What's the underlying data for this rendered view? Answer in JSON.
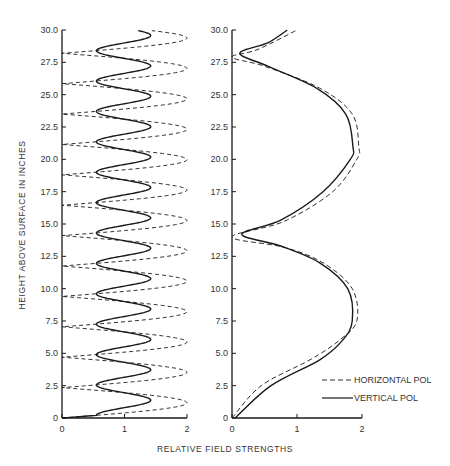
{
  "chart_data": [
    {
      "type": "line",
      "panel": "left",
      "title": "",
      "xlabel": "RELATIVE FIELD STRENGTHS",
      "ylabel": "HEIGHT ABOVE SURFACE IN INCHES",
      "xlim": [
        0,
        2
      ],
      "ylim": [
        0,
        30
      ],
      "x_ticks": [
        "0",
        "1",
        "2"
      ],
      "y_ticks": [
        "0",
        "2.5",
        "5.0",
        "7.5",
        "10.0",
        "12.5",
        "15.0",
        "17.5",
        "20.0",
        "22.5",
        "25.0",
        "27.5",
        "30.0"
      ],
      "grid": false,
      "series": [
        {
          "name": "HORIZONTAL POL",
          "style": "dashed",
          "description": "Oscillates between ~0 (nulls) and ~2.0 (peaks), period ~2.35 in",
          "nulls_at_height": [
            0,
            2.35,
            4.7,
            7.05,
            9.4,
            11.75,
            14.1,
            16.45,
            18.8,
            21.15,
            23.5,
            25.85,
            28.2
          ],
          "peaks_at_height": [
            1.18,
            3.53,
            5.88,
            8.23,
            10.58,
            12.93,
            15.28,
            17.63,
            19.98,
            22.33,
            24.68,
            27.03,
            29.38
          ],
          "min": 0.0,
          "max": 2.0
        },
        {
          "name": "VERTICAL POL",
          "style": "solid",
          "description": "Oscillates between ~0.55 and ~1.42, period ~2.35 in, starts at x≈0.55 at height 0",
          "minima_at_height": [
            0.2,
            2.55,
            4.9,
            7.25,
            9.6,
            11.95,
            14.3,
            16.65,
            19.0,
            21.35,
            23.7,
            26.05,
            28.4
          ],
          "maxima_at_height": [
            1.35,
            3.7,
            6.05,
            8.4,
            10.75,
            13.1,
            15.45,
            17.8,
            20.15,
            22.5,
            24.85,
            27.2,
            29.55
          ],
          "min": 0.55,
          "max": 1.42
        }
      ]
    },
    {
      "type": "line",
      "panel": "right",
      "title": "",
      "xlabel": "RELATIVE FIELD STRENGTHS",
      "ylabel": "",
      "xlim": [
        0,
        2
      ],
      "ylim": [
        0,
        30
      ],
      "x_ticks": [
        "0",
        "1",
        "2"
      ],
      "y_ticks": [
        "0",
        "2.5",
        "5.0",
        "7.5",
        "10.0",
        "12.5",
        "15.0",
        "17.5",
        "20.0",
        "22.5",
        "25.0",
        "27.5",
        "30.0"
      ],
      "grid": false,
      "legend_position": "lower right",
      "series": [
        {
          "name": "HORIZONTAL POL",
          "style": "dashed",
          "points": [
            [
              0.0,
              0
            ],
            [
              0.45,
              2.5
            ],
            [
              1.2,
              4.5
            ],
            [
              1.65,
              6
            ],
            [
              1.92,
              7.5
            ],
            [
              1.85,
              10
            ],
            [
              1.4,
              12
            ],
            [
              0.8,
              13.2
            ],
            [
              0.0,
              14.0
            ],
            [
              0.8,
              15.2
            ],
            [
              1.55,
              17.5
            ],
            [
              1.92,
              20
            ],
            [
              1.95,
              21
            ],
            [
              1.85,
              23.5
            ],
            [
              1.35,
              25.5
            ],
            [
              0.5,
              27.2
            ],
            [
              0.0,
              27.9
            ],
            [
              0.4,
              28.5
            ],
            [
              1.0,
              30
            ]
          ]
        },
        {
          "name": "VERTICAL POL",
          "style": "solid",
          "points": [
            [
              0.05,
              0
            ],
            [
              0.6,
              2.5
            ],
            [
              1.35,
              4.5
            ],
            [
              1.7,
              6
            ],
            [
              1.85,
              7.5
            ],
            [
              1.78,
              10
            ],
            [
              1.35,
              12
            ],
            [
              0.75,
              13.3
            ],
            [
              0.15,
              14.2
            ],
            [
              0.75,
              15.3
            ],
            [
              1.4,
              17.5
            ],
            [
              1.82,
              20
            ],
            [
              1.86,
              21
            ],
            [
              1.75,
              23.5
            ],
            [
              1.3,
              25.5
            ],
            [
              0.55,
              27.2
            ],
            [
              0.12,
              28.2
            ],
            [
              0.55,
              29
            ],
            [
              0.85,
              30
            ]
          ]
        }
      ]
    }
  ],
  "figure": {
    "ylabel": "HEIGHT ABOVE SURFACE IN INCHES",
    "xlabel": "RELATIVE FIELD STRENGTHS",
    "left_panel": {
      "x_tick_labels": [
        "0",
        "1",
        "2"
      ],
      "y_tick_labels": [
        "0",
        "2.5",
        "5.0",
        "7.5",
        "10.0",
        "12.5",
        "15.0",
        "17.5",
        "20.0",
        "22.5",
        "25.0",
        "27.5",
        "30.0"
      ]
    },
    "right_panel": {
      "x_tick_labels": [
        "0",
        "1",
        "2"
      ],
      "y_tick_labels": [
        "0",
        "2.5",
        "5.0",
        "7.5",
        "10.0",
        "12.5",
        "15.0",
        "17.5",
        "20.0",
        "22.5",
        "25.0",
        "27.5",
        "30.0"
      ]
    },
    "legend": {
      "items": [
        {
          "label": "HORIZONTAL POL",
          "style": "dashed"
        },
        {
          "label": "VERTICAL POL",
          "style": "solid"
        }
      ]
    },
    "colors": {
      "line": "#1a1a1a",
      "axis": "#1a1a1a",
      "text": "#333333"
    }
  }
}
